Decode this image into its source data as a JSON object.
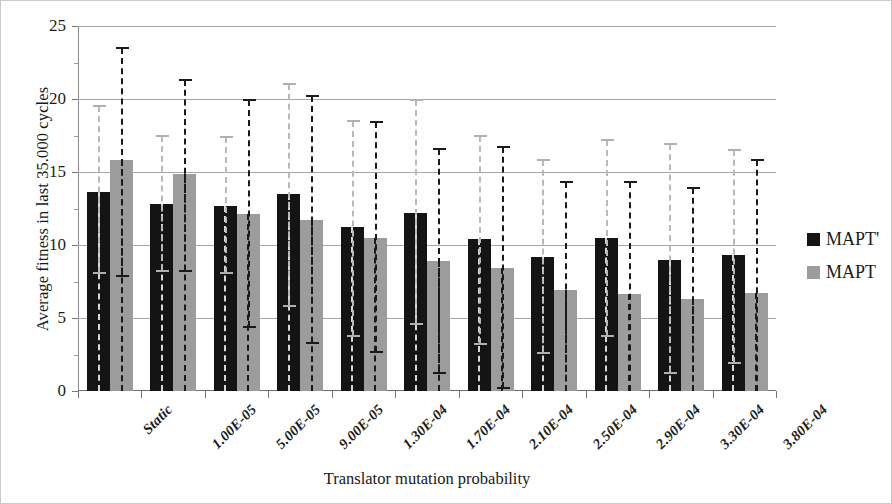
{
  "chart_data": {
    "type": "bar",
    "title": "",
    "xlabel": "Translator mutation probability",
    "ylabel": "Average fitness in last 35.000 cycles",
    "ylim": [
      0,
      25
    ],
    "yticks": [
      0,
      5,
      10,
      15,
      20,
      25
    ],
    "ytick_labels": [
      "0",
      "5",
      "10",
      "15",
      "20",
      "25"
    ],
    "grid": "horizontal",
    "legend_position": "right",
    "categories": [
      "Static",
      "1.00E-05",
      "5.00E-05",
      "9.00E-05",
      "1.30E-04",
      "1.70E-04",
      "2.10E-04",
      "2.50E-04",
      "2.90E-04",
      "3.30E-04",
      "3.80E-04"
    ],
    "series": [
      {
        "name": "MAPT'",
        "color": "#141414",
        "errorbar_color": "#b9b9b9",
        "values": [
          13.6,
          12.8,
          12.7,
          13.5,
          11.2,
          12.2,
          10.4,
          9.2,
          10.5,
          9.0,
          9.35
        ],
        "error_upper": [
          19.5,
          17.5,
          17.4,
          21.0,
          18.5,
          19.9,
          17.5,
          15.8,
          17.2,
          16.9,
          16.5
        ],
        "error_lower": [
          8.1,
          8.2,
          8.1,
          5.8,
          3.8,
          4.6,
          3.2,
          2.6,
          3.8,
          1.2,
          1.9
        ]
      },
      {
        "name": "MAPT",
        "color": "#9c9c9c",
        "errorbar_color": "#1a1a1a",
        "values": [
          15.8,
          14.85,
          12.1,
          11.7,
          10.5,
          8.9,
          8.4,
          6.9,
          6.65,
          6.3,
          6.7
        ],
        "error_upper": [
          23.5,
          21.3,
          19.9,
          20.2,
          18.4,
          16.6,
          16.7,
          14.3,
          14.3,
          13.9,
          15.8
        ],
        "error_lower": [
          7.9,
          8.2,
          4.4,
          3.3,
          2.7,
          1.2,
          0.2,
          0.0,
          0.0,
          0.0,
          0.0
        ]
      }
    ]
  },
  "legend": {
    "items": [
      {
        "label": "MAPT'"
      },
      {
        "label": "MAPT"
      }
    ]
  }
}
